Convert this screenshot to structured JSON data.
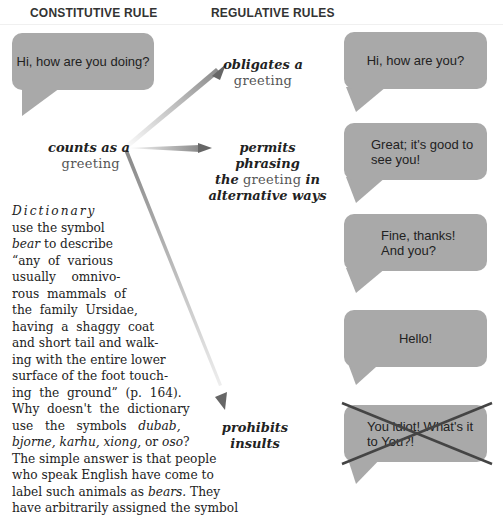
{
  "headers": {
    "constitutive": "CONSTITUTIVE RULE",
    "regulative": "REGULATIVE RULES"
  },
  "left_bubble": {
    "text": "Hi, how are you doing?"
  },
  "constitutive_rule": {
    "bold": "counts as a",
    "term": "greeting"
  },
  "regulative_rules": [
    {
      "bold1": "obligates a",
      "term": "greeting"
    },
    {
      "bold1": "permits phrasing",
      "bold2": "the",
      "term": "greeting",
      "bold3": "in",
      "bold4": "alternative ways"
    },
    {
      "bold1": "prohibits",
      "bold2": "insults"
    }
  ],
  "right_bubbles": [
    {
      "line1": "Hi, how are you?",
      "line2": "",
      "crossed": false
    },
    {
      "line1": "Great; it's good to",
      "line2": "see you!",
      "crossed": false
    },
    {
      "line1": "Fine, thanks!",
      "line2": "And you?",
      "crossed": false
    },
    {
      "line1": "Hello!",
      "line2": "",
      "crossed": false
    },
    {
      "line1": "You idiot! What's it",
      "line2": "to You?!",
      "crossed": true
    }
  ],
  "colors": {
    "bubble": "#a9a9a9",
    "arrow": "#666666",
    "cross": "#444444"
  },
  "paragraph": {
    "l1": "Dictionary",
    "l2": "use the symbol",
    "l3a": "bear",
    "l3b": " to describe",
    "l4": "“any  of  various",
    "l5": "usually    omnivo-",
    "l6": "rous  mammals  of",
    "l7": "the  family  Ursidae,",
    "l8": "having  a  shaggy  coat",
    "l9": "and short tail and walk-",
    "l10": "ing with the entire lower",
    "l11": "surface of the foot touch-",
    "l12": "ing  the  ground”  (p.  164).",
    "l13": "Why  doesn't  the  dictionary",
    "l14a": "use   the   symbols   ",
    "l14b": "dubab,",
    "l15a": "bjorne, karhu, xiong,",
    "l15b": " or ",
    "l15c": "oso",
    "l15d": "?",
    "l16": "The simple answer is that people",
    "l17": "who speak English have come to",
    "l18a": "label such animals as ",
    "l18b": "bears.",
    "l18c": " They",
    "l19": "have arbitrarily assigned the symbol"
  }
}
